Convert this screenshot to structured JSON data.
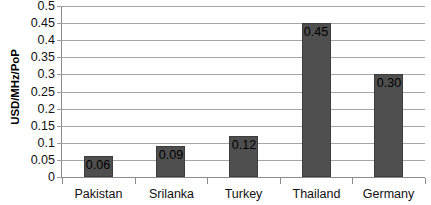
{
  "chart_data": {
    "type": "bar",
    "title": "",
    "subtitle": "",
    "xlabel": "",
    "ylabel": "USD/MHz/PoP",
    "categories": [
      "Pakistan",
      "Srilanka",
      "Turkey",
      "Thailand",
      "Germany"
    ],
    "values": [
      0.06,
      0.09,
      0.12,
      0.45,
      0.3
    ],
    "data_labels": [
      "0.06",
      "0.09",
      "0.12",
      "0.45",
      "0.30"
    ],
    "ylim": [
      0,
      0.5
    ],
    "ytick_values": [
      0,
      0.05,
      0.1,
      0.15,
      0.2,
      0.25,
      0.3,
      0.35,
      0.4,
      0.45,
      0.5
    ],
    "ytick_labels": [
      "0",
      "0.05",
      "0.1",
      "0.15",
      "0.2",
      "0.25",
      "0.3",
      "0.35",
      "0.4",
      "0.45",
      "0.5"
    ],
    "grid": true,
    "grid_axis": "y",
    "legend": false,
    "legend_position": "none",
    "series": [
      {
        "name": "USD/MHz/PoP",
        "values": [
          0.06,
          0.09,
          0.12,
          0.45,
          0.3
        ]
      }
    ],
    "colors": {
      "bar_fill": "#4f4f4f",
      "bar_border": "#3d3d3d",
      "gridline": "#a6a6a6",
      "axis_line": "#8c8c8c",
      "background": "#ffffff",
      "text": "#111111"
    }
  }
}
